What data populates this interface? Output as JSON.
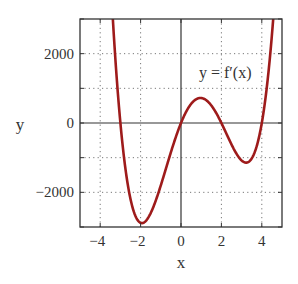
{
  "chart_data": {
    "type": "line",
    "title": "",
    "xlabel": "x",
    "ylabel": "y",
    "xlim": [
      -5,
      5
    ],
    "ylim": [
      -3000,
      3000
    ],
    "x_ticks": [
      -4,
      -2,
      0,
      2,
      4
    ],
    "x_tick_labels": [
      "−4",
      "−2",
      "0",
      "2",
      "4"
    ],
    "y_ticks": [
      -2000,
      0,
      2000
    ],
    "y_tick_labels": [
      "−2000",
      "0",
      "2000"
    ],
    "x_grid": [
      -4,
      -2,
      2,
      4
    ],
    "y_grid": [
      -2000,
      -1000,
      1000,
      2000
    ],
    "grid": true,
    "grid_style": "dotted",
    "annotations": [
      {
        "text": "y = f′(x)",
        "x": 3.05,
        "y": 1700
      }
    ],
    "series": [
      {
        "name": "y = f'(x)",
        "color": "#9e1b1b",
        "formula": "60*x*(x+3)*(x-2)*(x-4)",
        "x": [
          -3.4,
          -3.2,
          -3.0,
          -2.75,
          -2.5,
          -2.25,
          -2.0,
          -1.75,
          -1.5,
          -1.25,
          -1.0,
          -0.75,
          -0.5,
          -0.25,
          0.0,
          0.25,
          0.5,
          0.75,
          1.0,
          1.25,
          1.5,
          1.75,
          2.0,
          2.25,
          2.5,
          2.75,
          3.0,
          3.25,
          3.5,
          3.75,
          4.0,
          4.25,
          4.5,
          4.65
        ],
        "y": [
          3162,
          1498,
          0,
          -1328,
          -2194,
          -2680,
          -2880,
          -2815,
          -2552,
          -2142,
          -1620,
          -1063,
          -506,
          -46,
          0,
          292,
          619,
          702,
          720,
          628,
          506,
          315,
          0,
          -347,
          -619,
          -851,
          -1080,
          -1142,
          -926,
          -499,
          0,
          1090,
          2970,
          3240
        ]
      }
    ],
    "zero_lines": {
      "x": 0,
      "y": 0
    }
  }
}
